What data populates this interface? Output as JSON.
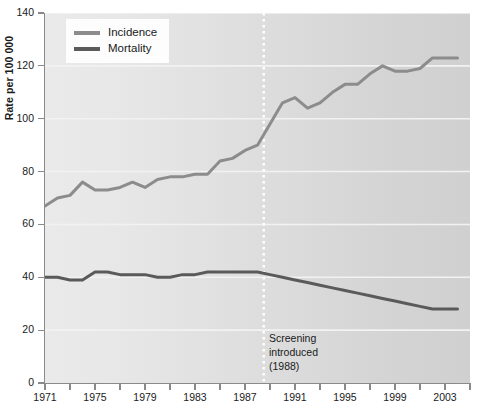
{
  "chart_data": {
    "type": "line",
    "title": "",
    "xlabel": "",
    "ylabel": "Rate per 100 000",
    "xlim": [
      1971,
      2005
    ],
    "ylim": [
      0,
      140
    ],
    "ytick_values": [
      0,
      20,
      40,
      60,
      80,
      100,
      120,
      140
    ],
    "ytick_labels": [
      "0",
      "20",
      "40",
      "60",
      "80",
      "100",
      "120",
      "140"
    ],
    "xtick_values": [
      1971,
      1973,
      1975,
      1977,
      1979,
      1981,
      1983,
      1985,
      1987,
      1989,
      1991,
      1993,
      1995,
      1997,
      1999,
      2001,
      2003,
      2005
    ],
    "xtick_labels": [
      "1971",
      "",
      "1975",
      "",
      "1979",
      "",
      "1983",
      "",
      "1987",
      "",
      "1991",
      "",
      "1995",
      "",
      "1999",
      "",
      "2003",
      ""
    ],
    "grid": "horizontal-white",
    "legend_position": "top-left",
    "x": [
      1971,
      1972,
      1973,
      1974,
      1975,
      1976,
      1977,
      1978,
      1979,
      1980,
      1981,
      1982,
      1983,
      1984,
      1985,
      1986,
      1987,
      1988,
      1989,
      1990,
      1991,
      1992,
      1993,
      1994,
      1995,
      1996,
      1997,
      1998,
      1999,
      2000,
      2001,
      2002,
      2003,
      2004
    ],
    "series": [
      {
        "name": "Incidence",
        "color": "#8c8c8c",
        "values": [
          67,
          70,
          71,
          76,
          73,
          73,
          74,
          76,
          74,
          77,
          78,
          78,
          79,
          79,
          84,
          85,
          88,
          90,
          98,
          106,
          108,
          104,
          106,
          110,
          113,
          113,
          117,
          120,
          118,
          118,
          119,
          123,
          123,
          123
        ]
      },
      {
        "name": "Mortality",
        "color": "#5a5a5a",
        "values": [
          40,
          40,
          39,
          39,
          42,
          42,
          41,
          41,
          41,
          40,
          40,
          41,
          41,
          42,
          42,
          42,
          42,
          42,
          41,
          40,
          39,
          38,
          37,
          36,
          35,
          34,
          33,
          32,
          31,
          30,
          29,
          28,
          28,
          28
        ]
      }
    ],
    "annotations": [
      {
        "name": "screening-marker",
        "x": 1988.5,
        "line_style": "dotted",
        "line_color": "#ffffff",
        "text_lines": [
          "Screening",
          "introduced",
          "(1988)"
        ]
      }
    ]
  },
  "legend": {
    "items": [
      {
        "label": "Incidence",
        "color": "#8c8c8c"
      },
      {
        "label": "Mortality",
        "color": "#5a5a5a"
      }
    ]
  },
  "axes": {
    "y_title": "Rate per 100 000"
  }
}
